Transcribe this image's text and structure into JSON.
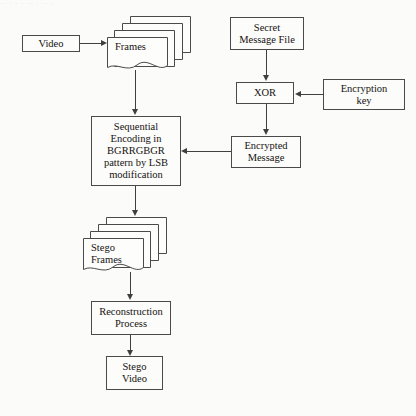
{
  "figure": {
    "top_cut_caption": "·· ·  ·   ·    ··     ·      ··       ·",
    "background_color": "#fbfbfa",
    "stroke_color": "#4a4a4a",
    "text_color": "#15120f"
  },
  "nodes": {
    "video": {
      "label": "Video",
      "shape": "rectangle"
    },
    "frames": {
      "label_line1": "Frames",
      "shape": "document-stack",
      "sheets": 4
    },
    "secret_message_file": {
      "label_line1": "Secret",
      "label_line2": "Message File",
      "shape": "rectangle"
    },
    "xor": {
      "label": "XOR",
      "shape": "rectangle"
    },
    "encryption_key": {
      "label_line1": "Encryption",
      "label_line2": "key",
      "shape": "rectangle"
    },
    "encrypted_message": {
      "label_line1": "Encrypted",
      "label_line2": "Message",
      "shape": "rectangle"
    },
    "encoding": {
      "label_line1": "Sequential",
      "label_line2": "Encoding in",
      "label_line3": "BGRRGBGR",
      "label_line4": "pattern by LSB",
      "label_line5": "modification",
      "shape": "rectangle"
    },
    "stego_frames": {
      "label_line1": "Stego",
      "label_line2": "Frames",
      "shape": "document-stack",
      "sheets": 4
    },
    "reconstruction_process": {
      "label_line1": "Reconstruction",
      "label_line2": "Process",
      "shape": "rectangle"
    },
    "stego_video": {
      "label_line1": "Stego",
      "label_line2": "Video",
      "shape": "rectangle"
    }
  },
  "edges": [
    {
      "from": "video",
      "to": "frames",
      "direction": "right"
    },
    {
      "from": "frames",
      "to": "encoding",
      "direction": "down"
    },
    {
      "from": "secret_message_file",
      "to": "xor",
      "direction": "down"
    },
    {
      "from": "encryption_key",
      "to": "xor",
      "direction": "left"
    },
    {
      "from": "xor",
      "to": "encrypted_message",
      "direction": "down"
    },
    {
      "from": "encrypted_message",
      "to": "encoding",
      "direction": "left"
    },
    {
      "from": "encoding",
      "to": "stego_frames",
      "direction": "down"
    },
    {
      "from": "stego_frames",
      "to": "reconstruction_process",
      "direction": "down"
    },
    {
      "from": "reconstruction_process",
      "to": "stego_video",
      "direction": "down"
    }
  ]
}
